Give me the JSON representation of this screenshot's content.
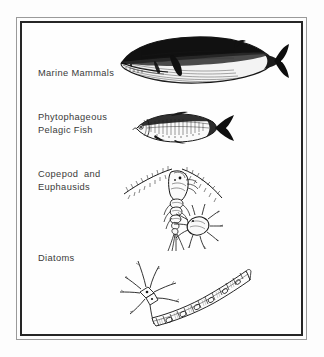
{
  "figure": {
    "kind": "marine-food-chain-diagram",
    "frame": {
      "style": "double-rule-border",
      "outer_color": "#9a9a9a",
      "inner_color": "#262626"
    },
    "background_color": "#fefefe",
    "text_color": "#3a3a3a",
    "ink_color": "#1a1a1a"
  },
  "trophic_levels": [
    {
      "id": "marine-mammals",
      "label": "Marine Mammals",
      "label_lines": [
        "Marine Mammals"
      ],
      "illustration": "baleen-whale",
      "illustration_description": "side view of a dark-backed rorqual whale with pale ventral grooves and a notched tail fluke, facing left"
    },
    {
      "id": "phytophageous-pelagic-fish",
      "label": "Phytophageous Pelagic Fish",
      "label_lines": [
        "Phytophageous",
        "Pelagic Fish"
      ],
      "illustration": "pelagic-fish",
      "illustration_description": "side view of a sardine-like schooling fish with scaled flank and dark forked tail, facing left"
    },
    {
      "id": "copepod-and-euphausids",
      "label": "Copepod and Euphausids",
      "label_lines": [
        "Copepod  and",
        "Euphausids"
      ],
      "illustration": "copepod-and-euphausid",
      "illustration_description": "copepod with long arcing feathered antennae and a segmented body, with a smaller round spiny-legged crustacean beside it"
    },
    {
      "id": "diatoms",
      "label": "Diatoms",
      "label_lines": [
        "Diatoms"
      ],
      "illustration": "diatoms",
      "illustration_description": "a star-shaped spiny diatom and a curved chain-forming diatom colony"
    }
  ]
}
